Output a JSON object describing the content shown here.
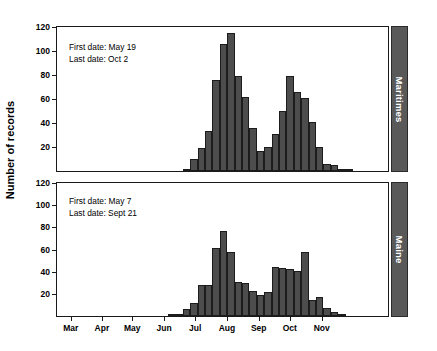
{
  "chart_data": {
    "type": "bar",
    "title": "",
    "xlabel": "",
    "ylabel": "Number of records",
    "ylim": [
      0,
      120
    ],
    "ytick_values": [
      20,
      40,
      60,
      80,
      100,
      120
    ],
    "xtick_labels": [
      "Mar",
      "Apr",
      "May",
      "Jun",
      "Jul",
      "Aug",
      "Sep",
      "Oct",
      "Nov"
    ],
    "grid": false,
    "legend": "none",
    "bar_color": "#4d4d4d",
    "panels": [
      {
        "name": "Maritimes",
        "strip_label": "Maritimes",
        "annotations": [
          "First date: May 19",
          "Last date: Oct 2"
        ],
        "first_date": "May 19",
        "last_date": "Oct 2",
        "bins": [
          {
            "x": 0.0,
            "value": 0
          },
          {
            "x": 1.0,
            "value": 0
          },
          {
            "x": 2.0,
            "value": 0
          },
          {
            "x": 3.0,
            "value": 0
          },
          {
            "x": 4.0,
            "value": 0
          },
          {
            "x": 5.0,
            "value": 0
          },
          {
            "x": 6.0,
            "value": 0
          },
          {
            "x": 7.0,
            "value": 0
          },
          {
            "x": 8.0,
            "value": 0
          },
          {
            "x": 9.0,
            "value": 0
          },
          {
            "x": 10.0,
            "value": 0
          },
          {
            "x": 11.0,
            "value": 0
          },
          {
            "x": 12.0,
            "value": 0
          },
          {
            "x": 13.0,
            "value": 0
          },
          {
            "x": 14.0,
            "value": 0
          },
          {
            "x": 15.0,
            "value": 0
          },
          {
            "x": 16.0,
            "value": 0
          },
          {
            "x": 17.0,
            "value": 2
          },
          {
            "x": 18.0,
            "value": 10
          },
          {
            "x": 19.0,
            "value": 19
          },
          {
            "x": 20.0,
            "value": 33
          },
          {
            "x": 21.0,
            "value": 76
          },
          {
            "x": 22.0,
            "value": 106
          },
          {
            "x": 23.0,
            "value": 115
          },
          {
            "x": 24.0,
            "value": 79
          },
          {
            "x": 25.0,
            "value": 62
          },
          {
            "x": 26.0,
            "value": 36
          },
          {
            "x": 27.0,
            "value": 17
          },
          {
            "x": 28.0,
            "value": 20
          },
          {
            "x": 29.0,
            "value": 31
          },
          {
            "x": 30.0,
            "value": 50
          },
          {
            "x": 31.0,
            "value": 79
          },
          {
            "x": 32.0,
            "value": 66
          },
          {
            "x": 33.0,
            "value": 61
          },
          {
            "x": 34.0,
            "value": 41
          },
          {
            "x": 35.0,
            "value": 20
          },
          {
            "x": 36.0,
            "value": 6
          },
          {
            "x": 37.0,
            "value": 5
          },
          {
            "x": 38.0,
            "value": 1
          },
          {
            "x": 39.0,
            "value": 2
          },
          {
            "x": 40.0,
            "value": 0
          },
          {
            "x": 41.0,
            "value": 0
          },
          {
            "x": 42.0,
            "value": 0
          },
          {
            "x": 43.0,
            "value": 0
          },
          {
            "x": 44.0,
            "value": 0
          }
        ]
      },
      {
        "name": "Maine",
        "strip_label": "Maine",
        "annotations": [
          "First date: May 7",
          "Last date: Sept 21"
        ],
        "first_date": "May 7",
        "last_date": "Sept 21",
        "bins": [
          {
            "x": 0.0,
            "value": 0
          },
          {
            "x": 1.0,
            "value": 0
          },
          {
            "x": 2.0,
            "value": 0
          },
          {
            "x": 3.0,
            "value": 0
          },
          {
            "x": 4.0,
            "value": 0
          },
          {
            "x": 5.0,
            "value": 0
          },
          {
            "x": 6.0,
            "value": 0
          },
          {
            "x": 7.0,
            "value": 0
          },
          {
            "x": 8.0,
            "value": 0
          },
          {
            "x": 9.0,
            "value": 0
          },
          {
            "x": 10.0,
            "value": 0
          },
          {
            "x": 11.0,
            "value": 0
          },
          {
            "x": 12.0,
            "value": 0
          },
          {
            "x": 13.0,
            "value": 0
          },
          {
            "x": 14.0,
            "value": 0
          },
          {
            "x": 15.0,
            "value": 1
          },
          {
            "x": 16.0,
            "value": 1
          },
          {
            "x": 17.0,
            "value": 6
          },
          {
            "x": 18.0,
            "value": 12
          },
          {
            "x": 19.0,
            "value": 28
          },
          {
            "x": 20.0,
            "value": 28
          },
          {
            "x": 21.0,
            "value": 61
          },
          {
            "x": 22.0,
            "value": 77
          },
          {
            "x": 23.0,
            "value": 58
          },
          {
            "x": 24.0,
            "value": 31
          },
          {
            "x": 25.0,
            "value": 30
          },
          {
            "x": 26.0,
            "value": 23
          },
          {
            "x": 27.0,
            "value": 19
          },
          {
            "x": 28.0,
            "value": 22
          },
          {
            "x": 29.0,
            "value": 44
          },
          {
            "x": 30.0,
            "value": 43
          },
          {
            "x": 31.0,
            "value": 42
          },
          {
            "x": 32.0,
            "value": 41
          },
          {
            "x": 33.0,
            "value": 58
          },
          {
            "x": 34.0,
            "value": 14
          },
          {
            "x": 35.0,
            "value": 17
          },
          {
            "x": 36.0,
            "value": 7
          },
          {
            "x": 37.0,
            "value": 4
          },
          {
            "x": 38.0,
            "value": 1
          },
          {
            "x": 39.0,
            "value": 0
          },
          {
            "x": 40.0,
            "value": 0
          },
          {
            "x": 41.0,
            "value": 0
          },
          {
            "x": 42.0,
            "value": 0
          },
          {
            "x": 43.0,
            "value": 0
          },
          {
            "x": 44.0,
            "value": 0
          }
        ]
      }
    ],
    "xtick_bin_positions": [
      2.0,
      6.2,
      10.3,
      14.6,
      18.8,
      23.1,
      27.4,
      31.6,
      35.9
    ]
  }
}
